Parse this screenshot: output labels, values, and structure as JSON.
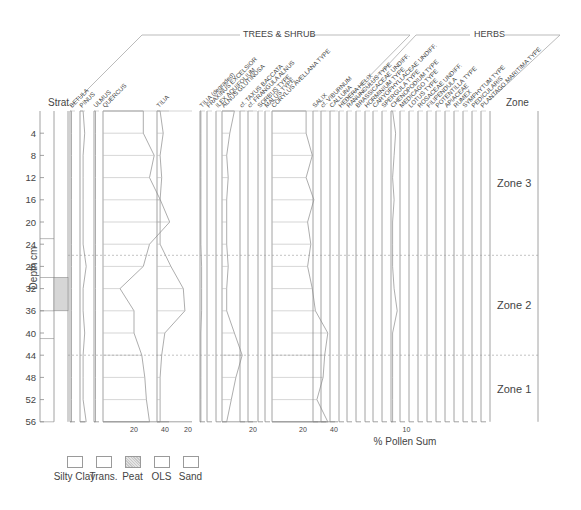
{
  "chart_data": {
    "type": "pollen-diagram",
    "title": "",
    "xlabel": "% Pollen Sum",
    "ylabel": "Depth cm",
    "depth_ticks": [
      4,
      8,
      12,
      16,
      20,
      24,
      28,
      32,
      36,
      40,
      44,
      48,
      52,
      56
    ],
    "depth_range": [
      0,
      56
    ],
    "sample_depths": [
      0,
      4,
      8,
      12,
      16,
      20,
      24,
      28,
      32,
      36,
      40,
      44,
      48,
      52,
      56
    ],
    "groups": [
      {
        "name": "TREES & SHRUB"
      },
      {
        "name": "HERBS"
      }
    ],
    "strat_column_label": "Strat",
    "zone_column_label": "Zone",
    "zones": [
      {
        "name": "Zone 3",
        "top": 0,
        "bottom": 26
      },
      {
        "name": "Zone 2",
        "top": 26,
        "bottom": 44
      },
      {
        "name": "Zone 1",
        "top": 44,
        "bottom": 56
      }
    ],
    "stratigraphy": [
      {
        "unit": "Silty Clay",
        "top": 0,
        "bottom": 23
      },
      {
        "unit": "Trans.",
        "top": 23,
        "bottom": 30
      },
      {
        "unit": "Peat",
        "top": 30,
        "bottom": 36
      },
      {
        "unit": "OLS",
        "top": 36,
        "bottom": 41
      },
      {
        "unit": "Sand",
        "top": 41,
        "bottom": 56
      }
    ],
    "legend": [
      "Silty Clay",
      "Trans.",
      "Peat",
      "OLS",
      "Sand"
    ],
    "series": [
      {
        "name": "BETULA",
        "group": "TREES & SHRUB",
        "values": [
          1,
          1,
          1,
          1,
          1,
          1,
          1,
          1,
          1,
          1,
          1,
          1,
          1,
          1,
          1
        ]
      },
      {
        "name": "PINUS",
        "group": "TREES & SHRUB",
        "values": [
          2,
          3,
          2,
          2,
          2,
          2,
          2,
          4,
          2,
          2,
          3,
          2,
          2,
          2,
          4
        ]
      },
      {
        "name": "ULMUS",
        "group": "TREES & SHRUB",
        "values": [
          1,
          1,
          1,
          1,
          1,
          1,
          1,
          1,
          1,
          1,
          1,
          1,
          1,
          1,
          1
        ]
      },
      {
        "name": "QUERCUS",
        "group": "TREES & SHRUB",
        "values": [
          26,
          26,
          33,
          30,
          37,
          43,
          30,
          26,
          11,
          20,
          20,
          25,
          27,
          28,
          30
        ],
        "axis_ticks": [
          20,
          40
        ]
      },
      {
        "name": "TILIA",
        "group": "TREES & SHRUB",
        "values": [
          2,
          4,
          2,
          3,
          2,
          2,
          2,
          9,
          17,
          18,
          5,
          3,
          2,
          2,
          2
        ],
        "axis_ticks": [
          20
        ]
      },
      {
        "name": "TILIA (degraded)",
        "group": "TREES & SHRUB",
        "values": [
          0,
          0,
          0,
          0,
          0,
          0,
          0,
          1,
          1,
          1,
          0,
          0,
          0,
          0,
          0
        ]
      },
      {
        "name": "FRAXINUS EXCELSIOR",
        "group": "TREES & SHRUB",
        "values": [
          0,
          0,
          0,
          0,
          0,
          0,
          0,
          0,
          0,
          0,
          0,
          0,
          0,
          0,
          0
        ]
      },
      {
        "name": "ILEX AQUIFOLIUM",
        "group": "TREES & SHRUB",
        "values": [
          0,
          0,
          0,
          0,
          0,
          0,
          0,
          0,
          0,
          0,
          0,
          0,
          0,
          0,
          0
        ]
      },
      {
        "name": "ALNUS GLUTINOSA",
        "group": "TREES & SHRUB",
        "values": [
          8,
          5,
          3,
          4,
          3,
          3,
          3,
          4,
          3,
          3,
          8,
          13,
          9,
          6,
          3
        ],
        "axis_ticks": [
          20
        ]
      },
      {
        "name": "cf. TAXUS BACCATA",
        "group": "TREES & SHRUB",
        "values": [
          0,
          0,
          0,
          0,
          0,
          0,
          0,
          0,
          0,
          0,
          0,
          0,
          0,
          0,
          0
        ]
      },
      {
        "name": "cf. FRANGULA ALNUS",
        "group": "TREES & SHRUB",
        "values": [
          0,
          0,
          0,
          0,
          0,
          0,
          0,
          0,
          0,
          0,
          0,
          0,
          0,
          0,
          0
        ]
      },
      {
        "name": "SORBUS TYPE",
        "group": "TREES & SHRUB",
        "values": [
          0,
          0,
          0,
          0,
          0,
          0,
          0,
          0,
          0,
          0,
          0,
          0,
          0,
          0,
          0
        ]
      },
      {
        "name": "MALUS TYPE",
        "group": "TREES & SHRUB",
        "values": [
          0,
          0,
          0,
          0,
          0,
          0,
          0,
          0,
          0,
          0,
          0,
          0,
          0,
          0,
          0
        ]
      },
      {
        "name": "CORYLUS AVELLANA TYPE",
        "group": "TREES & SHRUB",
        "values": [
          22,
          22,
          26,
          22,
          27,
          23,
          25,
          23,
          26,
          28,
          36,
          34,
          33,
          29,
          36
        ],
        "axis_ticks": [
          20,
          40
        ]
      },
      {
        "name": "SALIX",
        "group": "HERBS",
        "values": [
          0,
          0,
          0,
          0,
          0,
          0,
          0,
          0,
          0,
          0,
          0,
          0,
          0,
          0,
          0
        ]
      },
      {
        "name": "cf. VIBURNUM",
        "group": "HERBS",
        "values": [
          0,
          0,
          0,
          0,
          0,
          0,
          0,
          0,
          0,
          0,
          0,
          0,
          0,
          0,
          0
        ]
      },
      {
        "name": "CALLUNA",
        "group": "HERBS",
        "values": [
          0,
          0,
          0,
          0,
          0,
          0,
          0,
          0,
          0,
          0,
          0,
          0,
          0,
          0,
          0
        ]
      },
      {
        "name": "HEDERA HELIX",
        "group": "HERBS",
        "values": [
          0,
          0,
          0,
          0,
          0,
          0,
          0,
          0,
          0,
          0,
          0,
          0,
          0,
          0,
          0
        ]
      },
      {
        "name": "RANUNCULUS TYPE",
        "group": "HERBS",
        "values": [
          0,
          0,
          0,
          0,
          0,
          0,
          0,
          0,
          0,
          0,
          0,
          0,
          0,
          0,
          0
        ]
      },
      {
        "name": "BRASSICACEAE UNDIFF.",
        "group": "HERBS",
        "values": [
          0,
          0,
          0,
          0,
          0,
          0,
          0,
          0,
          0,
          0,
          0,
          0,
          0,
          0,
          0
        ]
      },
      {
        "name": "HORMINIUM TYPE",
        "group": "HERBS",
        "values": [
          0,
          0,
          0,
          0,
          0,
          0,
          0,
          0,
          0,
          0,
          0,
          0,
          0,
          0,
          0
        ]
      },
      {
        "name": "CARYOPHYLLACEAE UNDIFF.",
        "group": "HERBS",
        "values": [
          0,
          0,
          0,
          0,
          0,
          0,
          0,
          0,
          0,
          0,
          0,
          0,
          0,
          0,
          0
        ]
      },
      {
        "name": "SPERGULA TYPE",
        "group": "HERBS",
        "values": [
          0,
          0,
          0,
          0,
          0,
          0,
          0,
          0,
          0,
          0,
          0,
          0,
          0,
          0,
          0
        ]
      },
      {
        "name": "CHENOPODIUM TYPE",
        "group": "HERBS",
        "values": [
          1,
          3,
          2,
          1,
          2,
          1,
          1,
          1,
          2,
          4,
          1,
          1,
          1,
          1,
          1
        ],
        "axis_ticks": [
          10
        ]
      },
      {
        "name": "MEDICAGO TYPE",
        "group": "HERBS",
        "values": [
          0,
          0,
          0,
          0,
          0,
          0,
          0,
          0,
          0,
          0,
          0,
          0,
          0,
          0,
          0
        ]
      },
      {
        "name": "LOTUS TYPE",
        "group": "HERBS",
        "values": [
          0,
          0,
          0,
          0,
          0,
          0,
          0,
          0,
          0,
          0,
          0,
          0,
          0,
          0,
          0
        ]
      },
      {
        "name": "ROSACEAE UNDIFF.",
        "group": "HERBS",
        "values": [
          0,
          0,
          0,
          0,
          0,
          0,
          0,
          0,
          0,
          0,
          0,
          0,
          0,
          0,
          0
        ]
      },
      {
        "name": "FILIPENDULA",
        "group": "HERBS",
        "values": [
          0,
          0,
          0,
          0,
          0,
          0,
          0,
          0,
          0,
          0,
          0,
          0,
          0,
          0,
          0
        ]
      },
      {
        "name": "POTENTILLA TYPE",
        "group": "HERBS",
        "values": [
          0,
          0,
          0,
          0,
          0,
          0,
          0,
          0,
          0,
          0,
          0,
          0,
          0,
          0,
          0
        ]
      },
      {
        "name": "APIACEAE",
        "group": "HERBS",
        "values": [
          0,
          0,
          0,
          0,
          0,
          0,
          0,
          0,
          0,
          0,
          0,
          0,
          0,
          0,
          0
        ]
      },
      {
        "name": "RUMEX",
        "group": "HERBS",
        "values": [
          0,
          0,
          0,
          0,
          0,
          0,
          0,
          0,
          0,
          0,
          0,
          0,
          0,
          0,
          0
        ]
      },
      {
        "name": "SYMPHYTUM TYPE",
        "group": "HERBS",
        "values": [
          0,
          0,
          0,
          0,
          0,
          0,
          0,
          0,
          0,
          0,
          0,
          0,
          0,
          0,
          0
        ]
      },
      {
        "name": "PEDICULARIS",
        "group": "HERBS",
        "values": [
          0,
          0,
          0,
          0,
          0,
          0,
          0,
          0,
          0,
          0,
          0,
          0,
          0,
          0,
          0
        ]
      },
      {
        "name": "PLANTAGO MARITIMA TYPE",
        "group": "HERBS",
        "values": [
          0,
          0,
          0,
          0,
          0,
          0,
          0,
          0,
          0,
          0,
          0,
          0,
          0,
          0,
          0
        ]
      }
    ]
  },
  "labels": {
    "strat": "Strat",
    "zone": "Zone",
    "ylabel": "Depth cm",
    "xlabel": "% Pollen Sum",
    "group_trees": "TREES & SHRUB",
    "group_herbs": "HERBS"
  },
  "legend": [
    {
      "label": "Silty Clay",
      "pattern": "blank"
    },
    {
      "label": "Trans.",
      "pattern": "blank"
    },
    {
      "label": "Peat",
      "pattern": "stipple"
    },
    {
      "label": "OLS",
      "pattern": "blank"
    },
    {
      "label": "Sand",
      "pattern": "blank"
    }
  ],
  "colors": {
    "line": "#8a8a8a",
    "text": "#444444",
    "peat_fill": "#d6d6d6",
    "zone_line": "#9a9a9a"
  }
}
